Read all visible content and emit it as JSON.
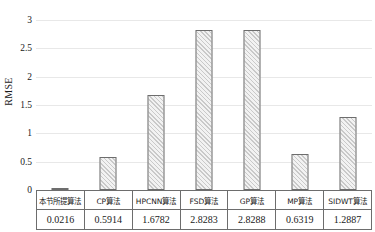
{
  "chart_data": {
    "type": "bar",
    "title": "",
    "xlabel": "",
    "ylabel": "RMSE",
    "ylim": [
      0,
      3
    ],
    "yticks": [
      "0",
      "0.5",
      "1",
      "1.5",
      "2",
      "2.5",
      "3"
    ],
    "ytick_values": [
      0,
      0.5,
      1,
      1.5,
      2,
      2.5,
      3
    ],
    "grid": true,
    "legend": "none",
    "categories": [
      "本节所提算法",
      "CP算法",
      "HPCNN算法",
      "FSD算法",
      "GP算法",
      "MP算法",
      "SIDWT算法"
    ],
    "values": [
      0.0216,
      0.5914,
      1.6782,
      2.8283,
      2.8288,
      0.6319,
      1.2887
    ],
    "value_labels": [
      "0.0216",
      "0.5914",
      "1.6782",
      "2.8283",
      "2.8288",
      "0.6319",
      "1.2887"
    ],
    "series_name": "RMSE",
    "bar_style": {
      "fill": "#f2f2f2",
      "hatch": "diagonal",
      "hatch_color": "#c9c9c9",
      "edge_color": "#6d6d6d"
    },
    "gridline_color": "#e8e8e8",
    "axis_color": "#8a8a8a",
    "table_border_color": "#6d6d6d",
    "text_color": "#1a1a1a"
  }
}
